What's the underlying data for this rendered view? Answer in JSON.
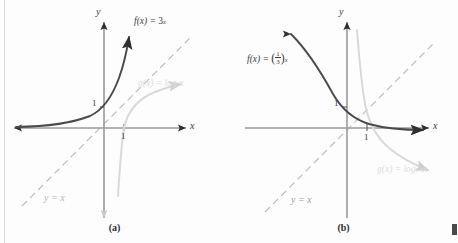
{
  "figure": {
    "panels": [
      {
        "id": "a",
        "caption": "(a)",
        "axis_x_label": "x",
        "axis_y_label": "y",
        "tick_y_label": "1",
        "tick_x_label": "1",
        "identity_label": "y = x",
        "exponential": {
          "label_prefix": "f(x) = ",
          "base": "3",
          "exponent": "x",
          "full_label": "f(x) = 3^x",
          "color": "#3a3a3a"
        },
        "logarithm": {
          "label_prefix": "g(x) = log",
          "base": "3",
          "argument": "x",
          "full_label": "g(x) = log_3 x",
          "color": "#d5d5d5"
        }
      },
      {
        "id": "b",
        "caption": "(b)",
        "axis_x_label": "x",
        "axis_y_label": "y",
        "tick_y_label": "1",
        "tick_x_label": "1",
        "identity_label": "y = x",
        "exponential": {
          "label_prefix": "f(x) = ",
          "base_num": "1",
          "base_den": "3",
          "exponent": "x",
          "full_label": "f(x) = (1/3)^x",
          "color": "#3a3a3a"
        },
        "logarithm": {
          "label_prefix": "g(x) = log",
          "base_num": "1",
          "base_den": "3",
          "argument": "x",
          "full_label": "g(x) = log_(1/3) x",
          "color": "#d5d5d5"
        }
      }
    ],
    "colors": {
      "axis": "#9a9a9a",
      "arrowhead": "#2f2f2f",
      "exponential_curve": "#4a4a4a",
      "logarithm_curve": "#d8d8d8",
      "identity_line": "#b9b9b9",
      "text_dark": "#3b3b3b",
      "text_light": "#d9d9d9",
      "background": "#fdfdfd"
    }
  }
}
